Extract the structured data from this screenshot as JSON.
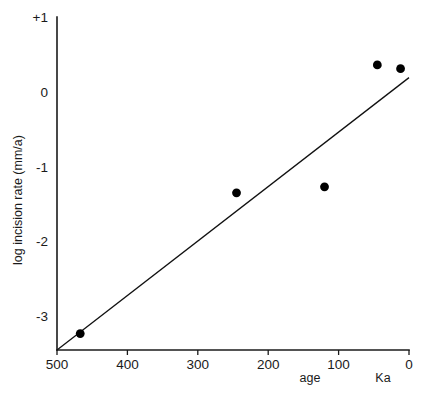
{
  "chart_data": {
    "type": "scatter",
    "title": "",
    "subtitle": "",
    "xlabel": "age",
    "xunit": "Ka",
    "ylabel": "log incision rate (mm/a)",
    "x_tick_labels": [
      "500",
      "400",
      "300",
      "200",
      "100",
      "0"
    ],
    "x_tick_values": [
      500,
      400,
      300,
      200,
      100,
      0
    ],
    "y_tick_labels": [
      "+1",
      "0",
      "-1",
      "-2",
      "-3"
    ],
    "y_tick_values": [
      1,
      0,
      -1,
      -2,
      -3
    ],
    "xlim": [
      500,
      0
    ],
    "ylim": [
      -3.45,
      1
    ],
    "x_axis_reversed": true,
    "grid": false,
    "legend": false,
    "points": [
      {
        "x": 467,
        "y": -3.23
      },
      {
        "x": 245,
        "y": -1.35
      },
      {
        "x": 120,
        "y": -1.27
      },
      {
        "x": 45,
        "y": 0.36
      },
      {
        "x": 12,
        "y": 0.31
      }
    ],
    "trend_line": {
      "x_start": 500,
      "y_start": -3.45,
      "x_end": 0,
      "y_end": 0.19
    },
    "marker": {
      "shape": "circle",
      "radius_px": 4.4,
      "color": "#000000"
    },
    "colors": {
      "axis": "#1a1a1a",
      "line": "#111111",
      "marker": "#000000",
      "background": "#ffffff"
    }
  },
  "geometry": {
    "x_left_px": 57,
    "x_right_px": 409,
    "y_top_px": 17,
    "y_bottom_px": 350,
    "y_unit_px": 75,
    "x_per_100ka_px": 70.4
  }
}
